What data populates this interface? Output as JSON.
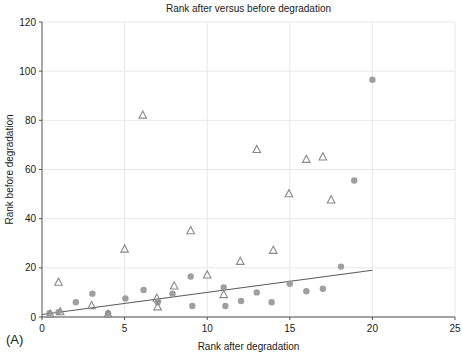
{
  "figure": {
    "panel_label": "(A)",
    "background_color": "#ffffff"
  },
  "chart_data": {
    "type": "scatter",
    "title": "Rank after versus before degradation",
    "xlabel": "Rank after degradation",
    "ylabel": "Rank before degradation",
    "xlim": [
      0,
      25
    ],
    "ylim": [
      0,
      120
    ],
    "xticks": [
      0,
      5,
      10,
      15,
      20,
      25
    ],
    "yticks": [
      0,
      20,
      40,
      60,
      80,
      100,
      120
    ],
    "xtick_labels": [
      "0",
      "5",
      "10",
      "15",
      "20",
      "25"
    ],
    "ytick_labels": [
      "0",
      "20",
      "40",
      "60",
      "80",
      "100",
      "120"
    ],
    "grid": true,
    "grid_color": "#e8e8e8",
    "legend": null,
    "marker_color": "#8a8a8a",
    "trendline_color": "#5a5a5a",
    "series": [
      {
        "name": "circles",
        "marker": "filled-circle",
        "color": "#9a9a9a",
        "points": [
          {
            "x": 0.45,
            "y": 1.5
          },
          {
            "x": 1.0,
            "y": 2.0
          },
          {
            "x": 2.05,
            "y": 6.0
          },
          {
            "x": 3.05,
            "y": 9.5
          },
          {
            "x": 4.0,
            "y": 1.5
          },
          {
            "x": 5.05,
            "y": 7.5
          },
          {
            "x": 6.15,
            "y": 11.0
          },
          {
            "x": 7.0,
            "y": 6.0
          },
          {
            "x": 7.9,
            "y": 9.5
          },
          {
            "x": 9.0,
            "y": 16.5
          },
          {
            "x": 9.1,
            "y": 4.5
          },
          {
            "x": 11.0,
            "y": 12.0
          },
          {
            "x": 11.1,
            "y": 4.5
          },
          {
            "x": 12.05,
            "y": 6.5
          },
          {
            "x": 13.0,
            "y": 10.0
          },
          {
            "x": 13.9,
            "y": 6.0
          },
          {
            "x": 15.0,
            "y": 13.5
          },
          {
            "x": 16.0,
            "y": 10.5
          },
          {
            "x": 17.0,
            "y": 11.5
          },
          {
            "x": 18.1,
            "y": 20.5
          },
          {
            "x": 18.9,
            "y": 55.5
          },
          {
            "x": 20.0,
            "y": 96.5
          }
        ]
      },
      {
        "name": "triangles",
        "marker": "open-triangle",
        "color": "#8a8a8a",
        "points": [
          {
            "x": 0.5,
            "y": 1.0
          },
          {
            "x": 1.0,
            "y": 14.0
          },
          {
            "x": 1.1,
            "y": 2.0
          },
          {
            "x": 3.0,
            "y": 4.5
          },
          {
            "x": 4.0,
            "y": 1.0
          },
          {
            "x": 5.0,
            "y": 27.5
          },
          {
            "x": 6.1,
            "y": 82.0
          },
          {
            "x": 6.95,
            "y": 7.5
          },
          {
            "x": 7.0,
            "y": 4.0
          },
          {
            "x": 8.0,
            "y": 12.5
          },
          {
            "x": 9.0,
            "y": 35.0
          },
          {
            "x": 10.0,
            "y": 17.0
          },
          {
            "x": 11.0,
            "y": 9.0
          },
          {
            "x": 12.0,
            "y": 22.5
          },
          {
            "x": 13.0,
            "y": 68.0
          },
          {
            "x": 14.0,
            "y": 27.0
          },
          {
            "x": 14.95,
            "y": 50.0
          },
          {
            "x": 16.0,
            "y": 64.0
          },
          {
            "x": 17.0,
            "y": 65.0
          },
          {
            "x": 17.5,
            "y": 47.5
          }
        ]
      }
    ],
    "trendline": {
      "name": "linear-fit",
      "x0": 0.0,
      "y0": 1.0,
      "x1": 20.0,
      "y1": 19.0
    }
  }
}
